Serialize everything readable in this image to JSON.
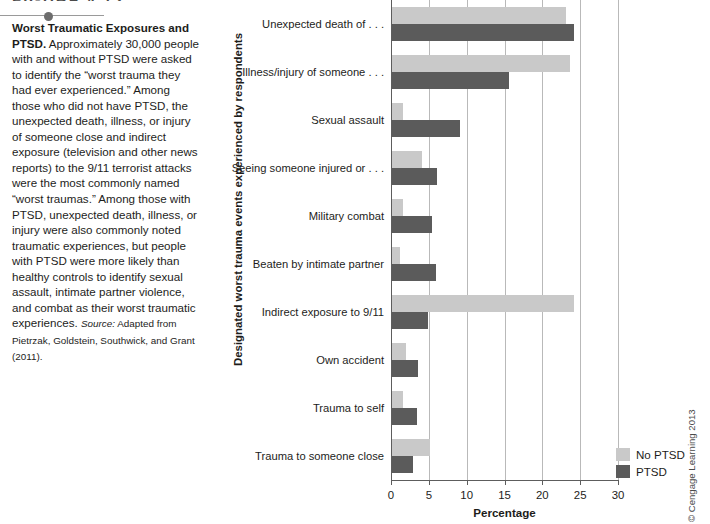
{
  "figure": {
    "header": "FIGURE 4.12",
    "caption_lead": "Worst Traumatic Exposures and PTSD.",
    "caption_body": " Approximately 30,000 people with and without PTSD were asked to identify the “worst trauma they had ever experienced.” Among those who did not have PTSD, the unexpected death, illness, or injury of someone close and indirect exposure (television and other news reports) to the 9/11 terrorist attacks were the most commonly named “worst traumas.” Among those with PTSD, unexpected death, illness, or injury were also commonly noted traumatic experiences, but people with PTSD were more likely than healthy controls to identify sexual assault, intimate partner violence, and combat as their worst traumatic experiences. ",
    "source_label": "Source:",
    "source_text": " Adapted from Pietrzak, Goldstein, Southwick, and Grant (2011).",
    "copyright": "© Cengage Learning 2013"
  },
  "legend": {
    "position": "bottom-right",
    "items": [
      {
        "label": "No PTSD",
        "color": "#c9c9c9"
      },
      {
        "label": "PTSD",
        "color": "#5b5b5b"
      }
    ]
  },
  "chart_data": {
    "type": "bar",
    "orientation": "horizontal",
    "title": "",
    "xlabel": "Percentage",
    "ylabel": "Designated worst trauma events experienced by respondents",
    "xlim": [
      0,
      30
    ],
    "xticks": [
      0,
      5,
      10,
      15,
      20,
      25,
      30
    ],
    "grid": true,
    "categories": [
      "Unexpected death of . . .",
      "Illness/injury of someone . . .",
      "Sexual assault",
      "Seeing someone injured or . . .",
      "Military combat",
      "Beaten by intimate partner",
      "Indirect exposure to 9/11",
      "Own accident",
      "Trauma to self",
      "Trauma to someone close"
    ],
    "series": [
      {
        "name": "No PTSD",
        "color": "#c9c9c9",
        "values": [
          23.0,
          23.5,
          1.5,
          4.0,
          1.5,
          1.0,
          24.0,
          1.8,
          1.5,
          5.0
        ]
      },
      {
        "name": "PTSD",
        "color": "#5b5b5b",
        "values": [
          24.0,
          15.4,
          9.0,
          6.0,
          5.3,
          5.8,
          4.8,
          3.5,
          3.3,
          2.8
        ]
      }
    ]
  }
}
